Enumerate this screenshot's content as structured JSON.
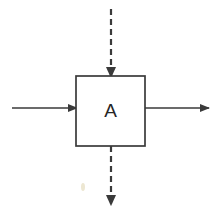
{
  "canvas": {
    "width": 218,
    "height": 214,
    "background_color": "#ffffff"
  },
  "diagram": {
    "type": "block-diagram",
    "stroke_color": "#3a3a3a",
    "block": {
      "label": "A",
      "x": 76,
      "y": 76,
      "width": 69,
      "height": 70,
      "fill": "#ffffff",
      "stroke_color": "#3a3a3a",
      "stroke_width": 1.7
    },
    "connectors": [
      {
        "name": "input-arrow-left",
        "style": "solid",
        "direction": "right",
        "x1": 12,
        "y1": 108,
        "x2": 77,
        "y2": 108,
        "stroke_width": 1.6,
        "arrowhead": "end"
      },
      {
        "name": "output-arrow-right",
        "style": "solid",
        "direction": "right",
        "x1": 145,
        "y1": 108,
        "x2": 209,
        "y2": 108,
        "stroke_width": 1.6,
        "arrowhead": "end"
      },
      {
        "name": "input-arrow-top",
        "style": "dashed",
        "direction": "down",
        "x1": 111,
        "y1": 9,
        "x2": 111,
        "y2": 77,
        "stroke_width": 2.2,
        "dash_pattern": "6 4",
        "arrowhead": "end"
      },
      {
        "name": "output-arrow-bottom",
        "style": "dashed",
        "direction": "down",
        "x1": 111,
        "y1": 146,
        "x2": 111,
        "y2": 205,
        "stroke_width": 2.2,
        "dash_pattern": "6 4",
        "arrowhead": "end"
      }
    ],
    "artifacts": [
      {
        "name": "scan-smudge",
        "x": 81,
        "y": 183,
        "width": 4,
        "height": 8,
        "color": "#ded3ad"
      }
    ]
  }
}
